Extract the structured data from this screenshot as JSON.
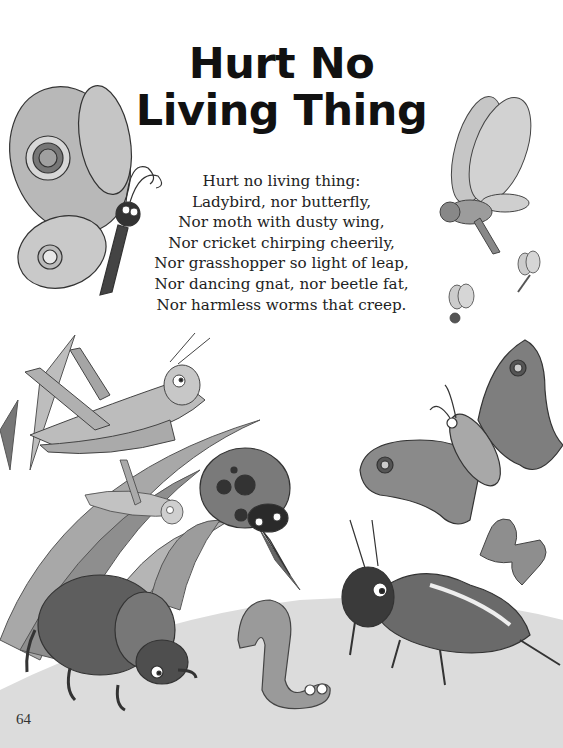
{
  "page": {
    "title_lines": [
      "Hurt No",
      "Living Thing"
    ],
    "poem_lines": [
      "Hurt no living thing:",
      "Ladybird, nor butterfly,",
      "Nor moth with dusty wing,",
      "Nor cricket chirping cheerily,",
      "Nor grasshopper so light of leap,",
      "Nor dancing gnat, nor beetle fat,",
      "Nor harmless worms that creep."
    ],
    "page_number": "64"
  },
  "illustrations": [
    {
      "name": "butterfly-illustration",
      "position": "top-left"
    },
    {
      "name": "gnat-illustration",
      "position": "top-right"
    },
    {
      "name": "small-gnat-illustration",
      "position": "right"
    },
    {
      "name": "grasshopper-illustration",
      "position": "middle-left"
    },
    {
      "name": "small-grasshopper-illustration",
      "position": "middle-left"
    },
    {
      "name": "ladybird-illustration",
      "position": "center"
    },
    {
      "name": "moth-illustration",
      "position": "middle-right"
    },
    {
      "name": "small-moth-illustration",
      "position": "right"
    },
    {
      "name": "beetle-illustration",
      "position": "bottom-left"
    },
    {
      "name": "worm-illustration",
      "position": "bottom-center"
    },
    {
      "name": "cricket-illustration",
      "position": "bottom-right"
    }
  ],
  "colors": {
    "ink": "#111111",
    "light_fill": "#c8c8c8",
    "mid_fill": "#9a9a9a",
    "dark_fill": "#4a4a4a",
    "ground": "#d9d9d9"
  }
}
